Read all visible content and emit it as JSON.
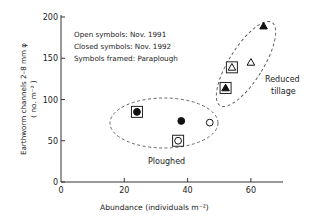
{
  "chart_data": {
    "type": "scatter",
    "title": "",
    "xlabel": "Abundance  (individuals m⁻²)",
    "ylabel": "Earthworm channels 2–8 mm φ",
    "ylabel2": "( no. m⁻² )",
    "xlim": [
      0,
      70
    ],
    "ylim": [
      0,
      200
    ],
    "xticks": [
      0,
      20,
      40,
      60
    ],
    "yticks": [
      0,
      50,
      100,
      150,
      200
    ],
    "grid": false,
    "legend": [
      "Open symbols: Nov. 1991",
      "Closed symbols: Nov. 1992",
      "Symbols framed: Paraplough"
    ],
    "annotations": [
      {
        "text": "Ploughed",
        "group": "circles"
      },
      {
        "text": "Reduced",
        "group": "triangles"
      },
      {
        "text": "tillage",
        "group": "triangles"
      }
    ],
    "series": [
      {
        "name": "Ploughed",
        "marker": "circle",
        "points": [
          {
            "x": 24,
            "y": 85,
            "filled": true,
            "framed": true,
            "date": "Nov. 1992",
            "tillage": "Paraplough"
          },
          {
            "x": 38,
            "y": 74,
            "filled": true,
            "framed": false,
            "date": "Nov. 1992",
            "tillage": "Ploughed"
          },
          {
            "x": 37,
            "y": 50,
            "filled": false,
            "framed": true,
            "date": "Nov. 1991",
            "tillage": "Paraplough"
          },
          {
            "x": 47,
            "y": 72,
            "filled": false,
            "framed": false,
            "date": "Nov. 1991",
            "tillage": "Ploughed"
          }
        ]
      },
      {
        "name": "Reduced tillage",
        "marker": "triangle",
        "points": [
          {
            "x": 52,
            "y": 114,
            "filled": true,
            "framed": true,
            "date": "Nov. 1992",
            "tillage": "Paraplough"
          },
          {
            "x": 54,
            "y": 139,
            "filled": false,
            "framed": true,
            "date": "Nov. 1991",
            "tillage": "Paraplough"
          },
          {
            "x": 60,
            "y": 145,
            "filled": false,
            "framed": false,
            "date": "Nov. 1991",
            "tillage": "Reduced tillage"
          },
          {
            "x": 64,
            "y": 189,
            "filled": true,
            "framed": false,
            "date": "Nov. 1992",
            "tillage": "Reduced tillage"
          }
        ]
      }
    ]
  },
  "colors": {
    "ink": "#222222",
    "dash": "#555555",
    "background": "#ffffff"
  }
}
